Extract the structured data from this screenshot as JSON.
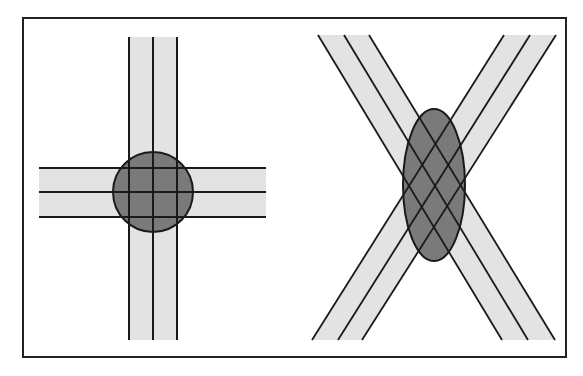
{
  "figure": {
    "colors": {
      "frame": "#222222",
      "beam_fill": "#e3e3e3",
      "beam_lines": "#1a1a1a",
      "overlap_fill": "#7a7a7a",
      "overlap_stroke": "#1a1a1a",
      "background": "#ffffff"
    },
    "frame": {
      "x": 23,
      "y": 18,
      "width": 543,
      "height": 339
    },
    "left_panel": {
      "label": "perpendicular-crossing",
      "vertical_beam": {
        "x_left": 129,
        "x_mid": 153,
        "x_right": 177,
        "y_top": 37,
        "y_bottom": 340
      },
      "horizontal_beam": {
        "y_top": 168,
        "y_mid": 192,
        "y_bottom": 217,
        "x_left": 39,
        "x_right": 266
      },
      "overlap_circle": {
        "cx": 153,
        "cy": 192,
        "r": 40
      }
    },
    "right_panel": {
      "label": "oblique-crossing",
      "beam_a": {
        "description": "top-left to bottom-right",
        "lines": [
          {
            "x1": 318,
            "y1": 35,
            "x2": 502,
            "y2": 340
          },
          {
            "x1": 344,
            "y1": 35,
            "x2": 528,
            "y2": 340
          },
          {
            "x1": 369,
            "y1": 35,
            "x2": 555,
            "y2": 340
          }
        ]
      },
      "beam_b": {
        "description": "top-right to bottom-left",
        "lines": [
          {
            "x1": 504,
            "y1": 35,
            "x2": 312,
            "y2": 340
          },
          {
            "x1": 530,
            "y1": 35,
            "x2": 338,
            "y2": 340
          },
          {
            "x1": 556,
            "y1": 35,
            "x2": 362,
            "y2": 340
          }
        ]
      },
      "overlap_ellipse": {
        "cx": 434,
        "cy": 185,
        "rx": 31,
        "ry": 76
      }
    }
  }
}
